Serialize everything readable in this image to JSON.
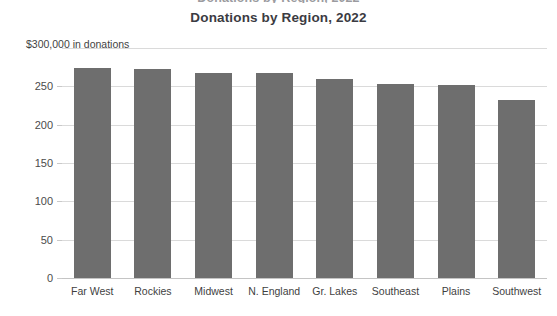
{
  "clipped_header": {
    "text": "Donations by Region, 2022"
  },
  "chart_data": {
    "type": "bar",
    "title": "Donations by Region, 2022",
    "subtitle": "",
    "xlabel": "",
    "ylabel": "$300,000 in donations",
    "y_axis_caption": "$300,000 in donations",
    "categories": [
      "Far West",
      "Rockies",
      "Midwest",
      "N. England",
      "Gr. Lakes",
      "Southeast",
      "Plains",
      "Southwest"
    ],
    "values": [
      274,
      272,
      267,
      267,
      259,
      253,
      252,
      232
    ],
    "ylim": [
      0,
      300
    ],
    "yticks": [
      0,
      50,
      100,
      150,
      200,
      250
    ],
    "ytick_labels": [
      "0",
      "50",
      "100",
      "150",
      "200",
      "250"
    ],
    "gridlines": [
      0,
      50,
      100,
      150,
      200,
      250,
      300
    ],
    "grid": true,
    "legend": false,
    "legend_position": "none",
    "bar_color": "#6e6e6e",
    "gridline_color": "#dadada",
    "axis_color": "#c4c4c4",
    "title_color": "#3b3b42",
    "label_color": "#3f3f3f",
    "background_color": "#ffffff"
  }
}
